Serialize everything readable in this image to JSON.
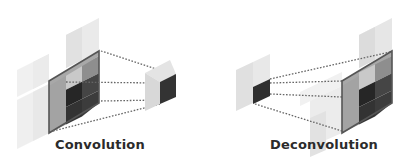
{
  "diagram": {
    "type": "convolution-vs-deconvolution",
    "panels": [
      {
        "id": "convolution",
        "label": "Convolution",
        "input": {
          "kind": "large-3d-grid",
          "cells": "3x3 with 2x2 dark kernel region"
        },
        "output": {
          "kind": "single-small-cell"
        },
        "direction": "large-to-small"
      },
      {
        "id": "deconvolution",
        "label": "Deconvolution",
        "input": {
          "kind": "single-small-cell"
        },
        "output": {
          "kind": "large-3d-grid",
          "cells": "3x3 with 2x2 dark region"
        },
        "direction": "small-to-large"
      }
    ],
    "connectors": {
      "style": "dotted",
      "count_per_panel": 4
    }
  },
  "colors": {
    "background": "#ffffff",
    "faint_tile": "#ececec",
    "light_tile": "#d6d6d6",
    "mid_gray": "#9a9a9a",
    "dark_cell": "#3a3a3a",
    "darkest_cell": "#262626",
    "border": "#555555",
    "dotted_line": "#6a6a6a",
    "text": "#2b2b2b"
  }
}
